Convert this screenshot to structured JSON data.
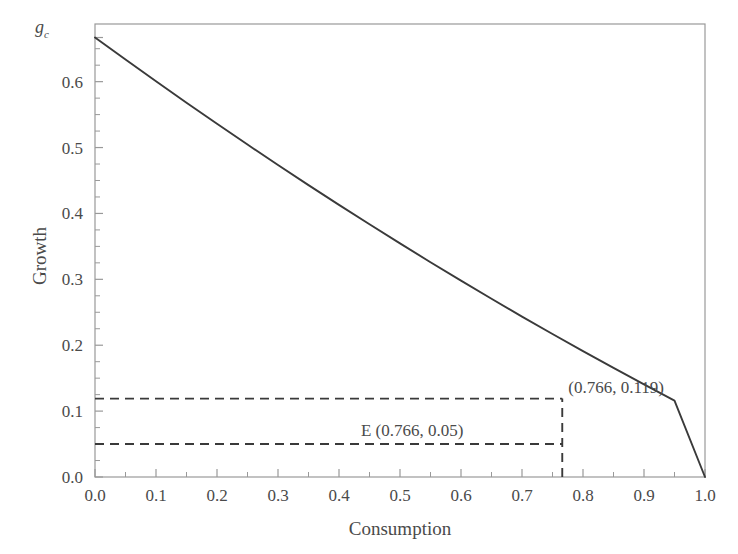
{
  "chart_data": {
    "type": "line",
    "title": "",
    "xlabel": "Consumption",
    "ylabel": "Growth",
    "xlim": [
      0.0,
      1.0
    ],
    "ylim": [
      0.0,
      0.6875
    ],
    "grid": false,
    "legend": null,
    "xticks": [
      "0.0",
      "0.1",
      "0.2",
      "0.3",
      "0.4",
      "0.5",
      "0.6",
      "0.7",
      "0.8",
      "0.9",
      "1.0"
    ],
    "xtick_values": [
      0.0,
      0.1,
      0.2,
      0.3,
      0.4,
      0.5,
      0.6,
      0.7,
      0.8,
      0.9,
      1.0
    ],
    "yticks": [
      "0.0",
      "0.1",
      "0.2",
      "0.3",
      "0.4",
      "0.5",
      "0.6"
    ],
    "ytick_values": [
      0.0,
      0.1,
      0.2,
      0.3,
      0.4,
      0.5,
      0.6
    ],
    "minor_xtick_values": [
      0.05,
      0.15,
      0.25,
      0.35,
      0.45,
      0.55,
      0.65,
      0.75,
      0.85,
      0.95
    ],
    "minor_ytick_values": [
      0.025,
      0.05,
      0.075,
      0.125,
      0.15,
      0.175,
      0.225,
      0.25,
      0.275,
      0.325,
      0.35,
      0.375,
      0.425,
      0.45,
      0.475,
      0.525,
      0.55,
      0.575,
      0.625,
      0.65
    ],
    "axis_corner_label": "g",
    "axis_corner_label_sub": "c",
    "axis_corner_label_value": 0.667,
    "series": [
      {
        "name": "growth-curve",
        "color": "#3a3a3a",
        "style": "solid",
        "x": [
          0.0,
          0.05,
          0.1,
          0.15,
          0.2,
          0.25,
          0.3,
          0.35,
          0.4,
          0.45,
          0.5,
          0.55,
          0.6,
          0.65,
          0.7,
          0.75,
          0.8,
          0.85,
          0.9,
          0.95,
          1.0
        ],
        "y": [
          0.667,
          0.6335,
          0.6005,
          0.568,
          0.536,
          0.5045,
          0.4735,
          0.443,
          0.413,
          0.3835,
          0.3545,
          0.326,
          0.298,
          0.2705,
          0.2435,
          0.217,
          0.191,
          0.1655,
          0.1405,
          0.116,
          0.0
        ]
      }
    ],
    "guides": [
      {
        "name": "upper-horizontal-guide",
        "style": "dashed",
        "color": "#3a3a3a",
        "orientation": "horizontal",
        "y": 0.119,
        "x_from": 0.0,
        "x_to": 0.766
      },
      {
        "name": "lower-horizontal-guide",
        "style": "dashed",
        "color": "#3a3a3a",
        "orientation": "horizontal",
        "y": 0.05,
        "x_from": 0.0,
        "x_to": 0.766
      },
      {
        "name": "vertical-guide",
        "style": "dashed",
        "color": "#3a3a3a",
        "orientation": "vertical",
        "x": 0.766,
        "y_from": 0.0,
        "y_to": 0.119
      }
    ],
    "annotations": [
      {
        "name": "intersection-annotation",
        "text": "(0.766, 0.119)",
        "x": 0.766,
        "y": 0.119
      },
      {
        "name": "equilibrium-annotation",
        "text": "E (0.766, 0.05)",
        "x": 0.52,
        "y": 0.072
      }
    ]
  },
  "axes": {
    "x_title": "Consumption",
    "y_title": "Growth",
    "corner_symbol": "g",
    "corner_symbol_subscript": "c"
  },
  "colors": {
    "curve": "#3a3a3a",
    "frame": "#999999",
    "text": "#4a4a4a",
    "background": "#ffffff",
    "guide": "#3a3a3a"
  }
}
